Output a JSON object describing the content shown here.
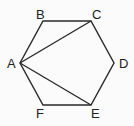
{
  "diagram": {
    "type": "regular-hexagon",
    "vertices": [
      {
        "name": "A",
        "x": 20,
        "y": 63,
        "lx": 7,
        "ly": 68
      },
      {
        "name": "B",
        "x": 43,
        "y": 21,
        "lx": 36,
        "ly": 19
      },
      {
        "name": "C",
        "x": 91,
        "y": 21,
        "lx": 92,
        "ly": 19
      },
      {
        "name": "D",
        "x": 114,
        "y": 63,
        "lx": 119,
        "ly": 68
      },
      {
        "name": "E",
        "x": 91,
        "y": 105,
        "lx": 91,
        "ly": 118
      },
      {
        "name": "F",
        "x": 43,
        "y": 105,
        "lx": 36,
        "ly": 118
      }
    ],
    "diagonals": [
      [
        "A",
        "C"
      ],
      [
        "A",
        "E"
      ]
    ],
    "stroke_color": "#2a2a2a"
  }
}
